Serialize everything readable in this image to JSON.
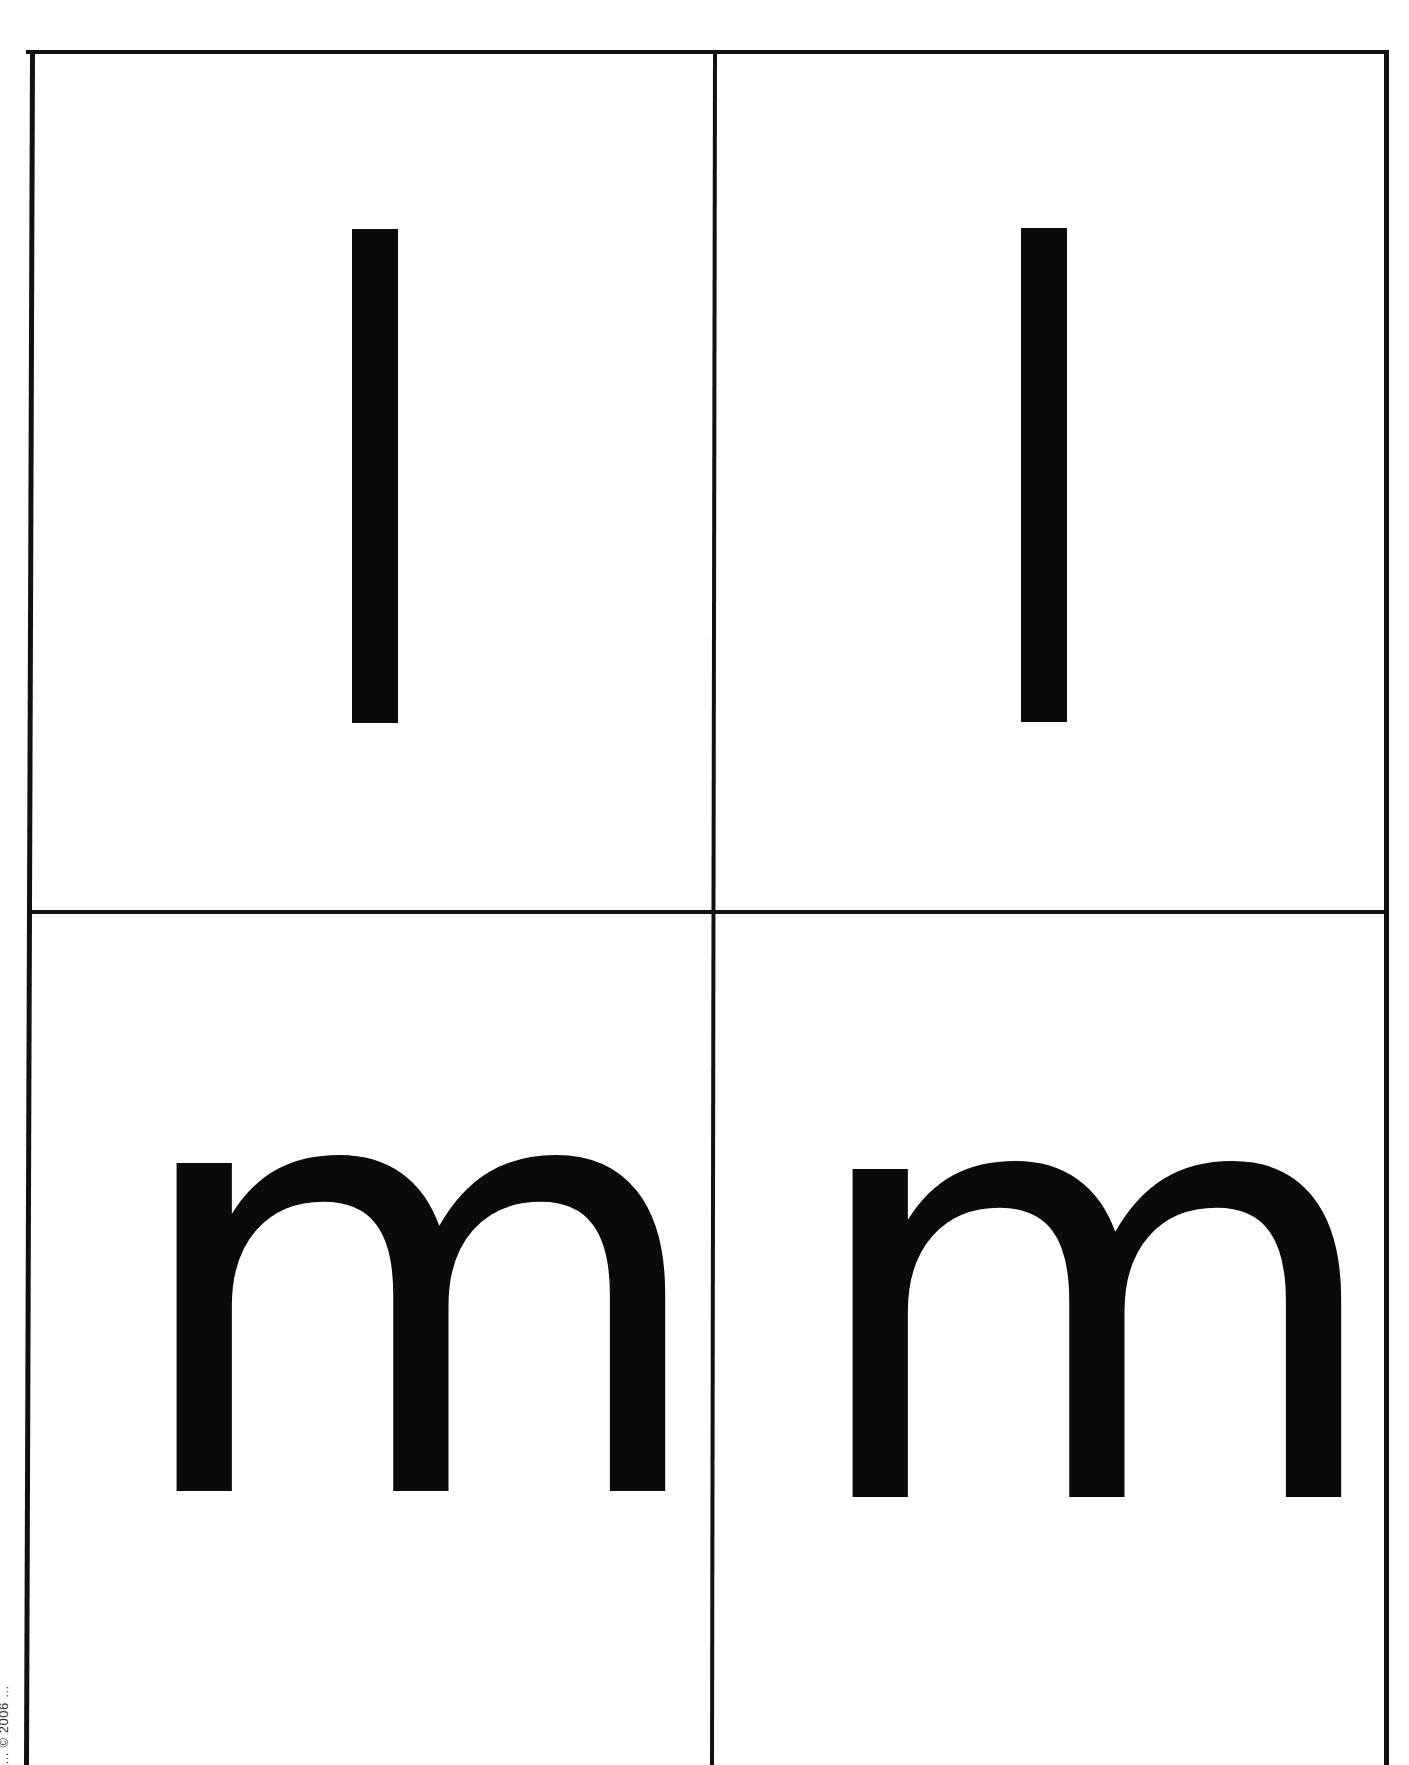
{
  "document": {
    "type": "letter flash cards",
    "colors": {
      "ink": "#0a0a0a",
      "grid": "#111111",
      "paper": "#ffffff"
    },
    "cards": [
      {
        "position": "top-left",
        "letter": "l"
      },
      {
        "position": "top-right",
        "letter": "l"
      },
      {
        "position": "bottom-left",
        "letter": "m"
      },
      {
        "position": "bottom-right",
        "letter": "m"
      }
    ],
    "footer_vertical_text": "… © 2006 …"
  }
}
